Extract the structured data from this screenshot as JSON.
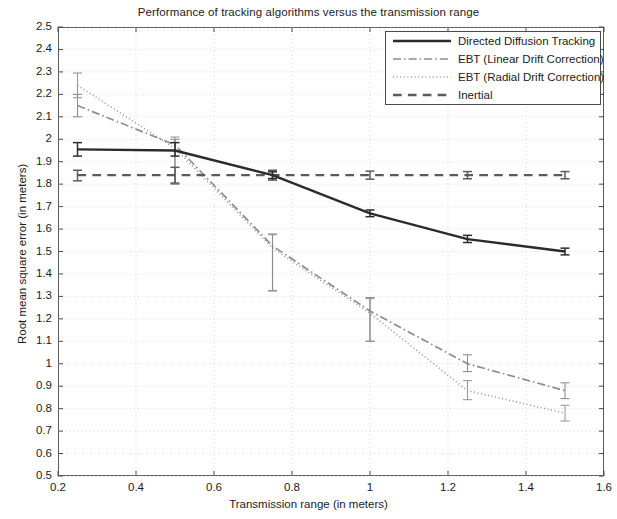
{
  "chart_data": {
    "type": "line",
    "title": "Performance of tracking algorithms versus the transmission range",
    "xlabel": "Transmission range (in meters)",
    "ylabel": "Root mean square error (in meters)",
    "xlim": [
      0.2,
      1.6
    ],
    "ylim": [
      0.5,
      2.5
    ],
    "xticks": [
      0.2,
      0.4,
      0.6,
      0.8,
      1,
      1.2,
      1.4,
      1.6
    ],
    "xtick_labels": [
      "0.2",
      "0.4",
      "0.6",
      "0.8",
      "1",
      "1.2",
      "1.4",
      "1.6"
    ],
    "yticks": [
      0.5,
      0.6,
      0.7,
      0.8,
      0.9,
      1.0,
      1.1,
      1.2,
      1.3,
      1.4,
      1.5,
      1.6,
      1.7,
      1.8,
      1.9,
      2.0,
      2.1,
      2.2,
      2.3,
      2.4,
      2.5
    ],
    "ytick_labels": [
      "0.5",
      "0.6",
      "0.7",
      "0.8",
      "0.9",
      "1",
      "1.1",
      "1.2",
      "1.3",
      "1.4",
      "1.5",
      "1.6",
      "1.7",
      "1.8",
      "1.9",
      "2",
      "2.1",
      "2.2",
      "2.3",
      "2.4",
      "2.5"
    ],
    "grid": true,
    "legend_position": "top-right",
    "x": [
      0.25,
      0.5,
      0.75,
      1.0,
      1.25,
      1.5
    ],
    "series": [
      {
        "name": "Directed Diffusion Tracking",
        "style": "solid",
        "color": "#2b2b2b",
        "width": 2.4,
        "values": [
          1.955,
          1.95,
          1.84,
          1.67,
          1.555,
          1.5
        ],
        "err_low": [
          1.925,
          1.925,
          1.825,
          1.655,
          1.54,
          1.485
        ],
        "err_high": [
          1.985,
          1.985,
          1.855,
          1.685,
          1.572,
          1.515
        ]
      },
      {
        "name": "EBT (Linear Drift Correction)",
        "style": "dashdot",
        "color": "#8d8d8d",
        "width": 1.7,
        "values": [
          2.15,
          1.975,
          1.525,
          1.235,
          1.0,
          0.88
        ],
        "err_low": [
          2.1,
          1.8,
          1.325,
          1.1,
          0.965,
          0.845
        ],
        "err_high": [
          2.2,
          2.0,
          1.578,
          1.295,
          1.04,
          0.915
        ]
      },
      {
        "name": "EBT (Radial Drift Correction)",
        "style": "dotted",
        "color": "#9a9a9a",
        "width": 1.7,
        "values": [
          2.24,
          1.96,
          1.515,
          1.225,
          0.88,
          0.78
        ],
        "err_low": [
          2.185,
          1.8,
          1.325,
          1.1,
          0.84,
          0.745
        ],
        "err_high": [
          2.295,
          2.01,
          1.575,
          1.29,
          0.925,
          0.815
        ]
      },
      {
        "name": "Inertial",
        "style": "dashed",
        "color": "#5a5a5a",
        "width": 2.4,
        "values": [
          1.84,
          1.84,
          1.84,
          1.84,
          1.84,
          1.84
        ],
        "err_low": [
          1.815,
          1.805,
          1.818,
          1.822,
          1.824,
          1.824
        ],
        "err_high": [
          1.862,
          1.875,
          1.862,
          1.858,
          1.856,
          1.856
        ]
      }
    ]
  },
  "legend": {
    "entries": [
      {
        "label": "Directed Diffusion Tracking"
      },
      {
        "label": "EBT (Linear Drift Correction)"
      },
      {
        "label": "EBT (Radial Drift Correction)"
      },
      {
        "label": "Inertial"
      }
    ]
  }
}
